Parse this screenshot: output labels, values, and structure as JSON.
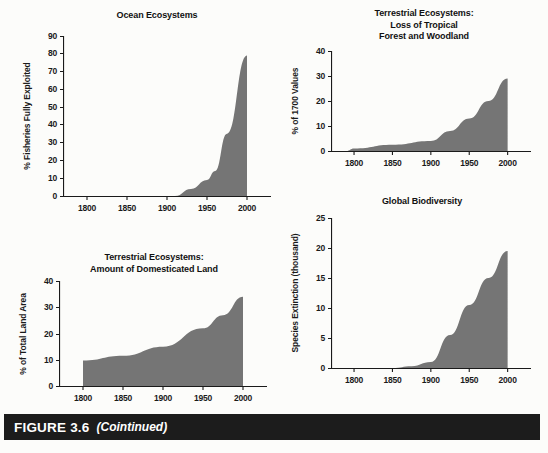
{
  "figure": {
    "label": "FIGURE 3.6",
    "note": "(Cointinued)",
    "bar_color": "#1c1c1c",
    "page_background": "#fcfcfa",
    "series_fill_color": "#757575"
  },
  "chart_data": [
    {
      "id": "ocean-ecosystems",
      "type": "area",
      "title": "Ocean Ecosystems",
      "xlabel": "",
      "ylabel": "% Fisheries Fully Exploited",
      "xlim": [
        1770,
        2020
      ],
      "ylim": [
        0,
        90
      ],
      "yticks": [
        0,
        10,
        20,
        30,
        40,
        50,
        60,
        70,
        80,
        90
      ],
      "xticks": [
        1800,
        1850,
        1900,
        1950,
        2000
      ],
      "grid": false,
      "legend": "none",
      "x": [
        1800,
        1850,
        1900,
        1910,
        1930,
        1950,
        1960,
        1975,
        2000
      ],
      "values": [
        0,
        0,
        0,
        0,
        4,
        9,
        14,
        35,
        79
      ]
    },
    {
      "id": "loss-of-tropical-forest",
      "type": "area",
      "title": "Terrestrial Ecosystems:\nLoss of Tropical\nForest and Woodland",
      "xlabel": "",
      "ylabel": "% of 1700 Values",
      "xlim": [
        1770,
        2020
      ],
      "ylim": [
        0,
        40
      ],
      "yticks": [
        0,
        10,
        20,
        30,
        40
      ],
      "xticks": [
        1800,
        1850,
        1900,
        1950,
        2000
      ],
      "grid": false,
      "legend": "none",
      "x": [
        1790,
        1800,
        1850,
        1900,
        1925,
        1950,
        1975,
        2000
      ],
      "values": [
        0,
        1,
        2.5,
        4,
        8,
        13,
        20,
        29
      ]
    },
    {
      "id": "domesticated-land",
      "type": "area",
      "title": "Terrestrial Ecosystems:\nAmount of Domesticated Land",
      "xlabel": "",
      "ylabel": "% of Total Land Area",
      "xlim": [
        1770,
        2020
      ],
      "ylim": [
        0,
        40
      ],
      "yticks": [
        0,
        10,
        20,
        30,
        40
      ],
      "xticks": [
        1800,
        1850,
        1900,
        1950,
        2000
      ],
      "grid": false,
      "legend": "none",
      "x": [
        1800,
        1850,
        1900,
        1950,
        1975,
        2000
      ],
      "values": [
        9.7,
        11.5,
        15,
        22,
        27,
        34
      ]
    },
    {
      "id": "global-biodiversity",
      "type": "area",
      "title": "Global Biodiversity",
      "xlabel": "",
      "ylabel": "Species Extinction (thousand)",
      "xlim": [
        1770,
        2020
      ],
      "ylim": [
        0,
        25
      ],
      "yticks": [
        0,
        5,
        10,
        15,
        20,
        25
      ],
      "xticks": [
        1800,
        1850,
        1900,
        1950,
        2000
      ],
      "grid": false,
      "legend": "none",
      "x": [
        1800,
        1850,
        1875,
        1900,
        1925,
        1950,
        1975,
        2000
      ],
      "values": [
        0,
        0,
        0.3,
        1,
        5.5,
        10.5,
        15,
        19.5
      ]
    }
  ]
}
